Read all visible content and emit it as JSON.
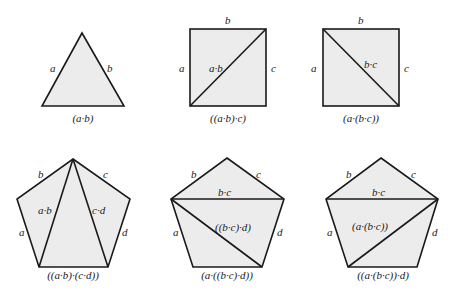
{
  "figures": [
    {
      "shape": "triangle",
      "edge_labels": [
        "a",
        "b"
      ],
      "diagonal_labels": [],
      "caption": "(a·b)"
    },
    {
      "shape": "square",
      "edge_labels": [
        "b",
        "a",
        "c"
      ],
      "diagonal_labels": [
        "a·b"
      ],
      "caption": "((a·b)·c)"
    },
    {
      "shape": "square",
      "edge_labels": [
        "b",
        "a",
        "c"
      ],
      "diagonal_labels": [
        "b·c"
      ],
      "caption": "(a·(b·c))"
    },
    {
      "shape": "pentagon",
      "edge_labels": [
        "b",
        "c",
        "a",
        "d"
      ],
      "diagonal_labels": [
        "a·b",
        "c·d"
      ],
      "caption": "((a·b)·(c·d))"
    },
    {
      "shape": "pentagon",
      "edge_labels": [
        "b",
        "c",
        "a",
        "d"
      ],
      "diagonal_labels": [
        "b·c",
        "((b·c)·d)"
      ],
      "caption": "(a·((b·c)·d))"
    },
    {
      "shape": "pentagon",
      "edge_labels": [
        "b",
        "c",
        "a",
        "d"
      ],
      "diagonal_labels": [
        "b·c",
        "(a·(b·c))"
      ],
      "caption": "((a·(b·c))·d)"
    }
  ]
}
